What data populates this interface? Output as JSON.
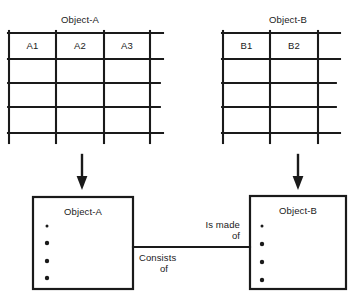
{
  "diagram": {
    "stroke_color": "#1a1a1a",
    "background_color": "#ffffff"
  },
  "tables": [
    {
      "id": "table-object-a",
      "title": "Object-A",
      "columns": [
        "A1",
        "A2",
        "A3"
      ],
      "extra_column_count": 1,
      "row_count": 4
    },
    {
      "id": "table-object-b",
      "title": "Object-B",
      "columns": [
        "B1",
        "B2"
      ],
      "extra_column_count": 1,
      "row_count": 4
    }
  ],
  "arrows": [
    {
      "id": "arrow-a",
      "direction": "down"
    },
    {
      "id": "arrow-b",
      "direction": "down"
    }
  ],
  "entities": [
    {
      "id": "entity-object-a",
      "title": "Object-A",
      "attribute_count": 4
    },
    {
      "id": "entity-object-b",
      "title": "Object-B",
      "attribute_count": 4
    }
  ],
  "relationship": {
    "id": "relationship-connector",
    "label_upper_line1": "Is made",
    "label_upper_line2": "of",
    "label_lower_line1": "Consists",
    "label_lower_line2": "of"
  }
}
